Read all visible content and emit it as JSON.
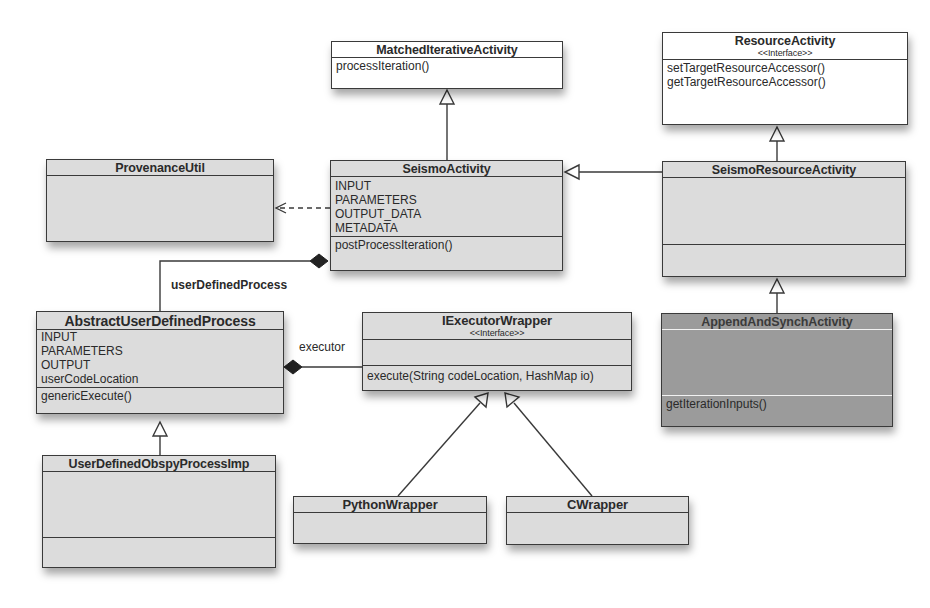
{
  "classes": {
    "matched_iterative_activity": {
      "name": "MatchedIterativeActivity",
      "attributes": [],
      "methods": [
        "processIteration()"
      ]
    },
    "resource_activity": {
      "name": "ResourceActivity",
      "stereotype": "<<Interface>>",
      "methods": [
        "setTargetResourceAccessor()",
        "getTargetResourceAccessor()"
      ]
    },
    "provenance_util": {
      "name": "ProvenanceUtil",
      "attributes": [],
      "methods": []
    },
    "seismo_activity": {
      "name": "SeismoActivity",
      "attributes": [
        "INPUT",
        "PARAMETERS",
        "OUTPUT_DATA",
        "METADATA"
      ],
      "methods": [
        "postProcessIteration()"
      ]
    },
    "seismo_resource_activity": {
      "name": "SeismoResourceActivity",
      "attributes": [],
      "methods": []
    },
    "abstract_user_defined_process": {
      "name": "AbstractUserDefinedProcess",
      "attributes": [
        "INPUT",
        "PARAMETERS",
        "OUTPUT",
        "userCodeLocation"
      ],
      "methods": [
        "genericExecute()"
      ]
    },
    "iexecutor_wrapper": {
      "name": "IExecutorWrapper",
      "stereotype": "<<Interface>>",
      "attributes": [],
      "methods": [
        "execute(String codeLocation, HashMap io)"
      ]
    },
    "append_and_synch_activity": {
      "name": "AppendAndSynchActivity",
      "attributes": [],
      "methods": [
        "getIterationInputs()"
      ]
    },
    "user_defined_obspy_process_imp": {
      "name": "UserDefinedObspyProcessImp",
      "attributes": [],
      "methods": []
    },
    "python_wrapper": {
      "name": "PythonWrapper",
      "attributes": []
    },
    "c_wrapper": {
      "name": "CWrapper",
      "attributes": []
    }
  },
  "relationships": {
    "user_defined_process_label": "userDefinedProcess",
    "executor_label": "executor"
  },
  "colors": {
    "box_fill": "#dcdcdc",
    "box_fill_white": "#ffffff",
    "box_fill_dark": "#9b9b9b",
    "line": "#3a3a3a"
  }
}
